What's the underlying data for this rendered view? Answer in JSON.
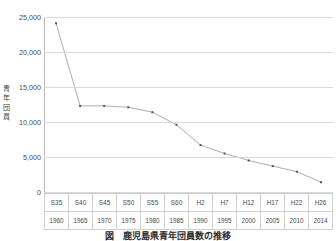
{
  "figure": {
    "caption": "図　鹿児島県青年団員数の推移",
    "y_axis_title_chars": [
      "青",
      "年",
      "団",
      "員"
    ]
  },
  "chart_data": {
    "type": "line",
    "title": "図　鹿児島県青年団員数の推移",
    "xlabel": "",
    "ylabel": "青年団員",
    "ylim": [
      0,
      25000
    ],
    "yticks": [
      25000,
      20000,
      15000,
      10000,
      5000,
      0
    ],
    "ytick_labels": [
      "25,000",
      "20,000",
      "15,000",
      "10,000",
      "5,000",
      "0"
    ],
    "grid": true,
    "legend": "none",
    "markers": true,
    "line_color": "#808080",
    "marker_color": "#555555",
    "categories_era": [
      "S35",
      "S40",
      "S45",
      "S50",
      "S55",
      "S60",
      "H2",
      "H7",
      "H12",
      "H17",
      "H22",
      "H26"
    ],
    "categories_year": [
      "1960",
      "1965",
      "1970",
      "1975",
      "1980",
      "1985",
      "1990",
      "1995",
      "2000",
      "2005",
      "2010",
      "2014"
    ],
    "values": [
      24100,
      12300,
      12300,
      12100,
      11400,
      9600,
      6700,
      5500,
      4500,
      3700,
      2900,
      1400
    ]
  }
}
